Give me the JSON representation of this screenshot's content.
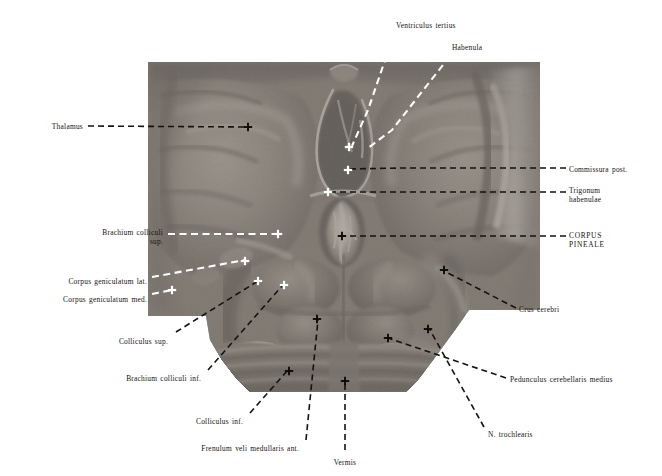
{
  "plate": {
    "kind": "anatomical-atlas-plate",
    "subject": "Dorsal view of the brain stem: thalamus, epithalamus, corpora quadrigemina and cerebellum",
    "background_color": "#ffffff",
    "ink_color": "#15120f",
    "photo_bounds": {
      "x": 148,
      "y": 62,
      "width": 392,
      "height": 330
    }
  },
  "labels": [
    {
      "id": "ventriculus-tertius",
      "text": "Ventriculus tertius",
      "align": "left",
      "x": 396,
      "y": 21,
      "style": "normal"
    },
    {
      "id": "habenula",
      "text": "Habenula",
      "align": "left",
      "x": 452,
      "y": 43,
      "style": "normal"
    },
    {
      "id": "thalamus",
      "text": "Thalamus",
      "align": "right",
      "x": 83,
      "y": 122,
      "style": "normal"
    },
    {
      "id": "commissura-post",
      "text": "Commissura post.",
      "align": "left",
      "x": 569,
      "y": 165,
      "style": "normal"
    },
    {
      "id": "trigonum-habenulae",
      "text": "Trigonum\nhabenulae",
      "align": "left",
      "x": 569,
      "y": 186,
      "style": "normal"
    },
    {
      "id": "corpus-pineale",
      "text": "CORPUS\nPINEALE",
      "align": "left",
      "x": 569,
      "y": 231,
      "style": "caps"
    },
    {
      "id": "brachium-colliculi-sup",
      "text": "Brachium colliculi\nsup.",
      "align": "right",
      "x": 163,
      "y": 228,
      "style": "normal"
    },
    {
      "id": "corpus-geniculatum-lat",
      "text": "Corpus geniculatum lat.",
      "align": "right",
      "x": 147,
      "y": 277,
      "style": "normal"
    },
    {
      "id": "corpus-geniculatum-med",
      "text": "Corpus geniculatum med.",
      "align": "right",
      "x": 147,
      "y": 295,
      "style": "normal"
    },
    {
      "id": "colliculus-sup",
      "text": "Colliculus sup.",
      "align": "right",
      "x": 168,
      "y": 337,
      "style": "normal"
    },
    {
      "id": "brachium-colliculi-inf",
      "text": "Brachium colliculi inf.",
      "align": "right",
      "x": 201,
      "y": 374,
      "style": "normal"
    },
    {
      "id": "colliculus-inf",
      "text": "Colliculus inf.",
      "align": "right",
      "x": 243,
      "y": 417,
      "style": "normal"
    },
    {
      "id": "frenulum-veli",
      "text": "Frenulum veli medullaris ant.",
      "align": "right",
      "x": 299,
      "y": 444,
      "style": "normal"
    },
    {
      "id": "vermis",
      "text": "Vermis",
      "align": "center",
      "x": 345,
      "y": 458,
      "style": "normal"
    },
    {
      "id": "crus-cerebri",
      "text": "Crus cerebri",
      "align": "left",
      "x": 519,
      "y": 305,
      "style": "normal"
    },
    {
      "id": "pedunculus-cerebellaris-medius",
      "text": "Pedunculus cerebellaris medius",
      "align": "left",
      "x": 510,
      "y": 375,
      "style": "normal"
    },
    {
      "id": "n-trochlearis",
      "text": "N. trochlearis",
      "align": "left",
      "x": 488,
      "y": 430,
      "style": "normal"
    }
  ],
  "leaders": [
    {
      "id": "leader-ventriculus-tertius",
      "target_label": "ventriculus-tertius",
      "color": "#ffffff",
      "style": "dashed",
      "points": "394,34 368,110 352,146"
    },
    {
      "id": "leader-habenula",
      "target_label": "habenula",
      "color": "#ffffff",
      "style": "dashed",
      "points": "450,56 392,130 368,148"
    },
    {
      "id": "leader-thalamus",
      "target_label": "thalamus",
      "color": "#15120f",
      "style": "dashed",
      "points": "88,126 246,127"
    },
    {
      "id": "leader-commissura-post",
      "target_label": "commissura-post",
      "color": "#15120f",
      "style": "dashed",
      "points": "566,168 400,168 348,169"
    },
    {
      "id": "leader-trigonum-habenulae",
      "target_label": "trigonum-habenulae",
      "color": "#15120f",
      "style": "dashed",
      "points": "566,192 400,192 330,192"
    },
    {
      "id": "leader-corpus-pineale",
      "target_label": "corpus-pineale",
      "color": "#15120f",
      "style": "dashed",
      "points": "566,236 420,236 341,236"
    },
    {
      "id": "leader-brachium-colliculi-sup",
      "target_label": "brachium-colliculi-sup",
      "color": "#ffffff",
      "style": "dashed",
      "points": "168,234 280,234"
    },
    {
      "id": "leader-corpus-geniculatum-lat",
      "target_label": "corpus-geniculatum-lat",
      "color": "#ffffff",
      "style": "dashed",
      "points": "152,277 245,260"
    },
    {
      "id": "leader-corpus-geniculatum-med",
      "target_label": "corpus-geniculatum-med",
      "color": "#ffffff",
      "style": "dashed",
      "points": "152,294 172,290"
    },
    {
      "id": "leader-colliculus-sup",
      "target_label": "colliculus-sup",
      "color": "#15120f",
      "style": "dashed",
      "points": "176,332 258,281"
    },
    {
      "id": "leader-brachium-colliculi-inf",
      "target_label": "brachium-colliculi-inf",
      "color": "#15120f",
      "style": "dashed",
      "points": "208,370 282,286"
    },
    {
      "id": "leader-colliculus-inf",
      "target_label": "colliculus-inf",
      "color": "#15120f",
      "style": "dashed",
      "points": "250,413 288,370"
    },
    {
      "id": "leader-frenulum-veli",
      "target_label": "frenulum-veli",
      "color": "#15120f",
      "style": "dashed",
      "points": "306,440 318,320"
    },
    {
      "id": "leader-vermis",
      "target_label": "vermis",
      "color": "#15120f",
      "style": "dashed",
      "points": "345,450 345,380"
    },
    {
      "id": "leader-crus-cerebri",
      "target_label": "crus-cerebri",
      "color": "#15120f",
      "style": "dashed",
      "points": "516,308 444,271"
    },
    {
      "id": "leader-pedunculus-cerebellaris-medius",
      "target_label": "pedunculus-cerebellaris-medius",
      "color": "#15120f",
      "style": "dashed",
      "points": "506,378 388,338"
    },
    {
      "id": "leader-n-trochlearis",
      "target_label": "n-trochlearis",
      "color": "#15120f",
      "style": "dashed",
      "points": "484,427 430,330"
    }
  ],
  "markers": [
    {
      "id": "marker-thalamus",
      "x": 248,
      "y": 127,
      "color": "#0d0b09"
    },
    {
      "id": "marker-ventriculus-tertius",
      "x": 349,
      "y": 147,
      "color": "#ffffff"
    },
    {
      "id": "marker-commissura-post",
      "x": 348,
      "y": 170,
      "color": "#ffffff"
    },
    {
      "id": "marker-trigonum-habenulae",
      "x": 328,
      "y": 192,
      "color": "#ffffff"
    },
    {
      "id": "marker-corpus-pineale",
      "x": 342,
      "y": 236,
      "color": "#0d0b09"
    },
    {
      "id": "marker-brachium-colliculi-sup",
      "x": 278,
      "y": 234,
      "color": "#ffffff"
    },
    {
      "id": "marker-corpus-geniculatum-lat",
      "x": 245,
      "y": 261,
      "color": "#ffffff"
    },
    {
      "id": "marker-corpus-geniculatum-med",
      "x": 172,
      "y": 290,
      "color": "#ffffff"
    },
    {
      "id": "marker-colliculus-sup",
      "x": 258,
      "y": 281,
      "color": "#ffffff"
    },
    {
      "id": "marker-brachium-colliculi-inf",
      "x": 284,
      "y": 285,
      "color": "#ffffff"
    },
    {
      "id": "marker-colliculus-inf",
      "x": 289,
      "y": 371,
      "color": "#0d0b09"
    },
    {
      "id": "marker-frenulum-veli",
      "x": 317,
      "y": 319,
      "color": "#0d0b09"
    },
    {
      "id": "marker-vermis",
      "x": 345,
      "y": 381,
      "color": "#0d0b09"
    },
    {
      "id": "marker-crus-cerebri",
      "x": 444,
      "y": 270,
      "color": "#0d0b09"
    },
    {
      "id": "marker-pedunculus-cerebellaris-medius",
      "x": 388,
      "y": 338,
      "color": "#0d0b09"
    },
    {
      "id": "marker-n-trochlearis",
      "x": 428,
      "y": 329,
      "color": "#0d0b09"
    }
  ]
}
